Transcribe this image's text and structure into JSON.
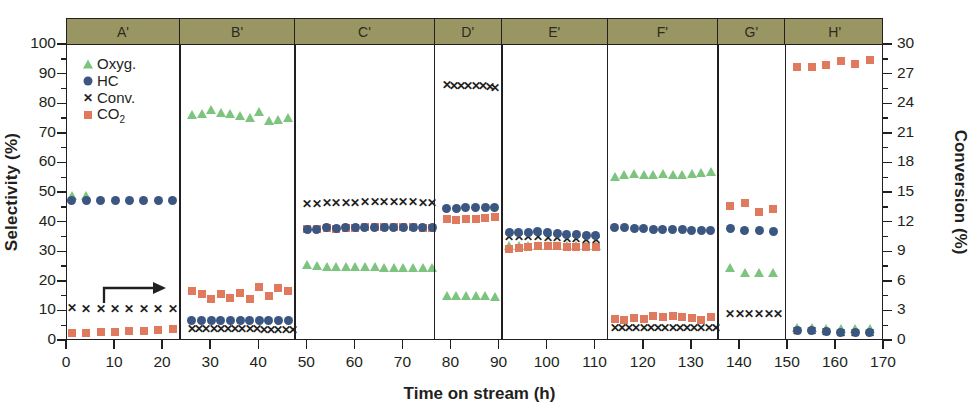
{
  "chart_data": {
    "type": "scatter",
    "title": "",
    "xlabel": "Time on stream (h)",
    "ylabel": "Selectivity (%)",
    "y2label": "Conversion (%)",
    "xlim": [
      0,
      170
    ],
    "ylim": [
      0,
      100
    ],
    "y2lim": [
      0,
      30
    ],
    "xticks": [
      0,
      10,
      20,
      30,
      40,
      50,
      60,
      70,
      80,
      90,
      100,
      110,
      120,
      130,
      140,
      150,
      160,
      170
    ],
    "yticks": [
      0,
      10,
      20,
      30,
      40,
      50,
      60,
      70,
      80,
      90,
      100
    ],
    "y2ticks": [
      0,
      3,
      6,
      9,
      12,
      15,
      18,
      21,
      24,
      27,
      30
    ],
    "grid": false,
    "legend_position": "top-left inside",
    "annotation_arrow": "right-pointing arrow indicating Conv. uses right axis",
    "legend": [
      {
        "name": "Oxyg.",
        "marker": "triangle",
        "color": "#7dc47f"
      },
      {
        "name": "HC",
        "marker": "circle",
        "color": "#3c5682"
      },
      {
        "name": "Conv.",
        "marker": "x",
        "color": "#231f20"
      },
      {
        "name": "CO2",
        "marker": "square",
        "color": "#e07a5f"
      }
    ],
    "panels": [
      {
        "label": "A'",
        "xrange": [
          0,
          23.5
        ],
        "series": [
          {
            "name": "Oxyg.",
            "axis": "left",
            "x": [
              1,
              4
            ],
            "y": [
              49,
              49
            ]
          },
          {
            "name": "HC",
            "axis": "left",
            "x": [
              1,
              4,
              7,
              10,
              13,
              16,
              19,
              22
            ],
            "y": [
              47.5,
              47.5,
              47.5,
              47.5,
              47.5,
              47.5,
              47.5,
              47.5
            ]
          },
          {
            "name": "Conv.",
            "axis": "right",
            "x": [
              1,
              4,
              7,
              10,
              13,
              16,
              19,
              22
            ],
            "y": [
              3.3,
              3.2,
              3.2,
              3.2,
              3.2,
              3.2,
              3.2,
              3.2
            ]
          },
          {
            "name": "CO2",
            "axis": "left",
            "x": [
              1,
              4,
              7,
              10,
              13,
              16,
              19,
              22
            ],
            "y": [
              2.8,
              2.8,
              3.0,
              3.2,
              3.4,
              3.5,
              3.6,
              4.2
            ]
          }
        ]
      },
      {
        "label": "B'",
        "xrange": [
          23.5,
          47.5
        ],
        "series": [
          {
            "name": "Oxyg.",
            "axis": "left",
            "x": [
              26,
              28,
              30,
              32,
              34,
              36,
              38,
              40,
              42,
              44,
              46
            ],
            "y": [
              76.5,
              76.8,
              78.2,
              77.0,
              76.8,
              76.0,
              75.3,
              77.5,
              74.2,
              74.8,
              75.3
            ]
          },
          {
            "name": "HC",
            "axis": "left",
            "x": [
              26,
              28,
              30,
              32,
              34,
              36,
              38,
              40,
              42,
              44,
              46
            ],
            "y": [
              6.8,
              6.8,
              6.8,
              6.8,
              6.8,
              6.8,
              6.8,
              6.8,
              6.8,
              6.8,
              6.8
            ]
          },
          {
            "name": "Conv.",
            "axis": "right",
            "x": [
              26,
              27.5,
              29,
              30.5,
              32,
              33.5,
              35,
              36.5,
              38,
              39.5,
              41,
              42.5,
              44,
              45.5,
              47
            ],
            "y": [
              1.2,
              1.2,
              1.2,
              1.2,
              1.2,
              1.2,
              1.2,
              1.2,
              1.2,
              1.2,
              1.1,
              1.1,
              1.1,
              1.1,
              1.1
            ]
          },
          {
            "name": "CO2",
            "axis": "left",
            "x": [
              26,
              28,
              30,
              32,
              34,
              36,
              38,
              40,
              42,
              44,
              46
            ],
            "y": [
              16.8,
              16.0,
              14.3,
              15.8,
              14.6,
              16.2,
              14.2,
              18.2,
              15.2,
              17.8,
              16.8
            ]
          }
        ]
      },
      {
        "label": "C'",
        "xrange": [
          47.5,
          76.5
        ],
        "series": [
          {
            "name": "Oxyg.",
            "axis": "left",
            "x": [
              50,
              52,
              54,
              56,
              58,
              60,
              62,
              64,
              66,
              68,
              70,
              72,
              74,
              76
            ],
            "y": [
              25.8,
              25.2,
              25.0,
              25.0,
              25.0,
              25.0,
              25.0,
              25.0,
              24.8,
              24.8,
              24.8,
              24.8,
              24.6,
              24.5
            ]
          },
          {
            "name": "HC",
            "axis": "left",
            "x": [
              50,
              52,
              54,
              56,
              58,
              60,
              62,
              64,
              66,
              68,
              70,
              72,
              74,
              76
            ],
            "y": [
              37.8,
              37.8,
              38.2,
              38.0,
              38.2,
              38.2,
              38.5,
              38.5,
              38.5,
              38.5,
              38.5,
              38.5,
              38.3,
              38.3
            ]
          },
          {
            "name": "Conv.",
            "axis": "right",
            "x": [
              50,
              52,
              54,
              56,
              58,
              60,
              62,
              64,
              66,
              68,
              70,
              72,
              74,
              76
            ],
            "y": [
              13.8,
              13.8,
              13.9,
              13.9,
              13.9,
              13.9,
              14.0,
              14.0,
              14.0,
              14.0,
              14.0,
              14.0,
              13.9,
              13.9
            ]
          },
          {
            "name": "CO2",
            "axis": "left",
            "x": [
              50,
              52,
              54,
              56,
              58,
              60,
              62,
              64,
              66,
              68,
              70,
              72,
              74,
              76
            ],
            "y": [
              37.8,
              37.8,
              38.2,
              38.0,
              38.2,
              38.2,
              38.5,
              38.5,
              38.5,
              38.5,
              38.5,
              38.5,
              38.3,
              38.3
            ]
          }
        ]
      },
      {
        "label": "D'",
        "xrange": [
          76.5,
          90.5
        ],
        "series": [
          {
            "name": "Oxyg.",
            "axis": "left",
            "x": [
              79,
              81,
              83,
              85,
              87,
              89
            ],
            "y": [
              15.2,
              15.2,
              15.2,
              15.2,
              15.2,
              15.0
            ]
          },
          {
            "name": "HC",
            "axis": "left",
            "x": [
              79,
              81,
              83,
              85,
              87,
              89
            ],
            "y": [
              44.8,
              44.8,
              45.0,
              45.0,
              45.2,
              45.2
            ]
          },
          {
            "name": "Conv.",
            "axis": "right",
            "x": [
              79,
              80.5,
              82,
              83.5,
              85,
              86.5,
              88,
              89
            ],
            "y": [
              25.9,
              25.8,
              25.8,
              25.8,
              25.8,
              25.8,
              25.7,
              25.6
            ]
          },
          {
            "name": "CO2",
            "axis": "left",
            "x": [
              79,
              81,
              83,
              85,
              87,
              89
            ],
            "y": [
              41.2,
              41.0,
              41.2,
              41.2,
              41.5,
              41.8
            ]
          }
        ]
      },
      {
        "label": "E'",
        "xrange": [
          90.5,
          112.5
        ],
        "series": [
          {
            "name": "Oxyg.",
            "axis": "left",
            "x": [
              92,
              94,
              96,
              98,
              100,
              102,
              104,
              106,
              108,
              110
            ],
            "y": [
              32.0,
              32.0,
              32.2,
              32.2,
              32.2,
              32.2,
              32.0,
              32.0,
              32.0,
              32.0
            ]
          },
          {
            "name": "HC",
            "axis": "left",
            "x": [
              92,
              94,
              96,
              98,
              100,
              102,
              104,
              106,
              108,
              110
            ],
            "y": [
              36.5,
              36.5,
              36.8,
              37.0,
              36.5,
              36.2,
              36.0,
              36.0,
              35.8,
              35.8
            ]
          },
          {
            "name": "Conv.",
            "axis": "right",
            "x": [
              92,
              94,
              96,
              98,
              100,
              102,
              104,
              106,
              108,
              110
            ],
            "y": [
              10.5,
              10.5,
              10.5,
              10.5,
              10.4,
              10.4,
              10.3,
              10.3,
              10.2,
              10.2
            ]
          },
          {
            "name": "CO2",
            "axis": "left",
            "x": [
              92,
              94,
              96,
              98,
              100,
              102,
              104,
              106,
              108,
              110
            ],
            "y": [
              31.0,
              31.5,
              31.8,
              32.0,
              32.0,
              32.0,
              31.8,
              31.8,
              31.8,
              31.8
            ]
          }
        ]
      },
      {
        "label": "F'",
        "xrange": [
          112.5,
          135.5
        ],
        "series": [
          {
            "name": "Oxyg.",
            "axis": "left",
            "x": [
              114,
              116,
              118,
              120,
              122,
              124,
              126,
              128,
              130,
              132,
              134
            ],
            "y": [
              55.5,
              56.2,
              56.5,
              56.0,
              56.2,
              56.5,
              56.0,
              56.2,
              56.5,
              56.8,
              57.0
            ]
          },
          {
            "name": "HC",
            "axis": "left",
            "x": [
              114,
              116,
              118,
              120,
              122,
              124,
              126,
              128,
              130,
              132,
              134
            ],
            "y": [
              38.5,
              38.2,
              38.0,
              38.0,
              37.8,
              37.8,
              37.8,
              37.8,
              37.5,
              37.5,
              37.5
            ]
          },
          {
            "name": "Conv.",
            "axis": "right",
            "x": [
              114,
              115.5,
              117,
              118.5,
              120,
              121.5,
              123,
              124.5,
              126,
              127.5,
              129,
              130.5,
              132,
              133.5,
              135
            ],
            "y": [
              1.3,
              1.3,
              1.3,
              1.3,
              1.3,
              1.3,
              1.3,
              1.3,
              1.3,
              1.3,
              1.3,
              1.3,
              1.3,
              1.3,
              1.3
            ]
          },
          {
            "name": "CO2",
            "axis": "left",
            "x": [
              114,
              116,
              118,
              120,
              122,
              124,
              126,
              128,
              130,
              132,
              134
            ],
            "y": [
              7.5,
              7.2,
              7.8,
              7.5,
              8.5,
              8.0,
              8.5,
              8.2,
              7.8,
              7.2,
              8.0
            ]
          }
        ]
      },
      {
        "label": "G'",
        "xrange": [
          135.5,
          149.5
        ],
        "series": [
          {
            "name": "Oxyg.",
            "axis": "left",
            "x": [
              138,
              141,
              144,
              147
            ],
            "y": [
              24.5,
              23.0,
              23.0,
              23.0
            ]
          },
          {
            "name": "HC",
            "axis": "left",
            "x": [
              138,
              141,
              144,
              147
            ],
            "y": [
              38.0,
              37.5,
              37.2,
              37.0
            ]
          },
          {
            "name": "Conv.",
            "axis": "right",
            "x": [
              138,
              140,
              142,
              144,
              146,
              148
            ],
            "y": [
              2.7,
              2.7,
              2.7,
              2.7,
              2.7,
              2.7
            ]
          },
          {
            "name": "CO2",
            "axis": "left",
            "x": [
              138,
              141,
              144,
              147
            ],
            "y": [
              45.5,
              46.5,
              43.5,
              44.5
            ]
          }
        ]
      },
      {
        "label": "H'",
        "xrange": [
          149.5,
          170
        ],
        "series": [
          {
            "name": "Oxyg.",
            "axis": "left",
            "x": [
              152,
              155,
              158,
              161,
              164,
              167
            ],
            "y": [
              4.5,
              4.5,
              4.2,
              4.0,
              4.0,
              4.0
            ]
          },
          {
            "name": "HC",
            "axis": "left",
            "x": [
              152,
              155,
              158,
              161,
              164,
              167
            ],
            "y": [
              3.5,
              3.5,
              3.2,
              2.8,
              2.8,
              2.8
            ]
          },
          {
            "name": "Conv.",
            "axis": "right",
            "x": [
              152,
              155,
              158,
              161,
              164,
              167
            ],
            "y": [
              1.0,
              1.0,
              0.9,
              0.8,
              0.8,
              0.8
            ]
          },
          {
            "name": "CO2",
            "axis": "left",
            "x": [
              152,
              155,
              158,
              161,
              164,
              167
            ],
            "y": [
              92.5,
              92.5,
              93.2,
              94.5,
              93.5,
              94.8
            ]
          }
        ]
      }
    ]
  },
  "colors": {
    "oxyg": "#7dc47f",
    "hc": "#3c5682",
    "conv": "#231f20",
    "co2": "#e07a5f",
    "header_band": "#9a9663",
    "axis": "#231f20",
    "background": "#ffffff"
  }
}
